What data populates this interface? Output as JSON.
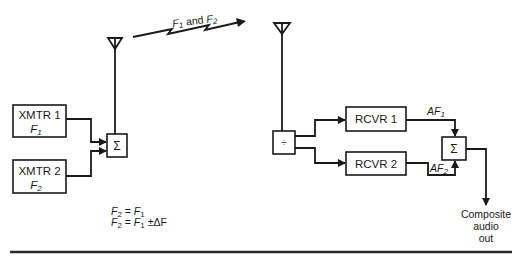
{
  "diagram": {
    "type": "block-diagram",
    "title": "",
    "link_label": {
      "prefix": "F",
      "sub1": "1",
      "mid": " and ",
      "prefix2": "F",
      "sub2": "2"
    },
    "transmitters": [
      {
        "label": "XMTR 1",
        "freq": "F",
        "freq_sub": "1"
      },
      {
        "label": "XMTR 2",
        "freq": "F",
        "freq_sub": "2"
      }
    ],
    "tx_combiner": {
      "symbol": "Σ"
    },
    "rx_splitter": {
      "symbol": "÷"
    },
    "receivers": [
      {
        "label": "RCVR 1",
        "out_label": "AF",
        "out_sub": "1"
      },
      {
        "label": "RCVR 2",
        "out_label": "AF",
        "out_sub": "2"
      }
    ],
    "rx_combiner": {
      "symbol": "Σ"
    },
    "output": {
      "lines": [
        "Composite",
        "audio",
        "out"
      ]
    },
    "equations": [
      {
        "lhs": "F",
        "lhs_sub": "2",
        "eq": " = ",
        "rhs": "F",
        "rhs_sub": "1",
        "extra": ""
      },
      {
        "lhs": "F",
        "lhs_sub": "2",
        "eq": " = ",
        "rhs": "F",
        "rhs_sub": "1",
        "extra": " ±ΔF"
      }
    ],
    "colors": {
      "line": "#1a1a1a",
      "background": "#ffffff"
    }
  }
}
